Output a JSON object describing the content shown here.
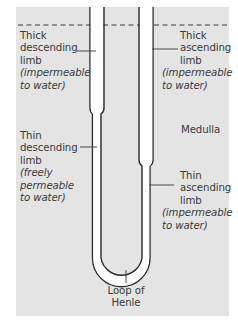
{
  "diagram": {
    "title": "Loop of Henle",
    "colors": {
      "background": "#ffffff",
      "panel": "#e4e4e4",
      "tube_fill": "#ffffff",
      "tube_stroke": "#2a2a2a",
      "text": "#3a3a3a",
      "pointer": "#4a4a4a",
      "dashed_line": "#3a3a3a"
    },
    "labels": {
      "thick_descending": {
        "lines": [
          "Thick",
          "descending",
          "limb"
        ],
        "note": [
          "(impermeable",
          "to water)"
        ]
      },
      "thick_ascending": {
        "lines": [
          "Thick",
          "ascending",
          "limb"
        ],
        "note": [
          "(impermeable",
          "to water)"
        ]
      },
      "thin_descending": {
        "lines": [
          "Thin",
          "descending",
          "limb"
        ],
        "note": [
          "(freely",
          "permeable",
          "to water)"
        ]
      },
      "thin_ascending": {
        "lines": [
          "Thin",
          "ascending",
          "limb"
        ],
        "note": [
          "(impermeable",
          "to water)"
        ]
      },
      "medulla": "Medulla",
      "loop": [
        "Loop of",
        "Henle"
      ]
    }
  }
}
